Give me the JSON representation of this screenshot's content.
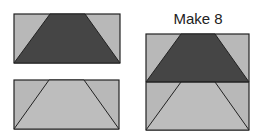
{
  "title": "Make 8",
  "colors": {
    "light": "#b8b8b8",
    "dark": "#444444",
    "stroke": "#222222",
    "background": "#ffffff"
  },
  "diagram": {
    "units": [
      {
        "name": "dark-trapezoid-block",
        "trapezoid_color": "dark",
        "background_color": "light"
      },
      {
        "name": "light-trapezoid-block",
        "trapezoid_color": "light",
        "background_color": "light"
      }
    ],
    "combined": {
      "label": "Make 8",
      "stack": [
        "dark-trapezoid-block",
        "light-trapezoid-block"
      ]
    }
  }
}
